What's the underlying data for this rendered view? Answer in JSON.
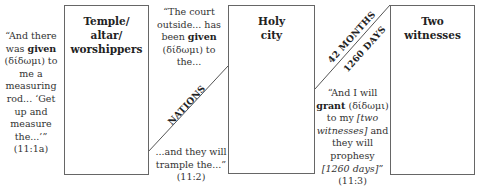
{
  "boxes": [
    {
      "id": "temple",
      "title_lines": [
        "Temple/",
        "altar/",
        "worshippers"
      ]
    },
    {
      "id": "holy-city",
      "title_lines": [
        "Holy",
        "city"
      ]
    },
    {
      "id": "two-witnesses",
      "title_lines": [
        "Two",
        "witnesses"
      ]
    }
  ],
  "quotes": {
    "q1": {
      "pre": "“And there was ",
      "bold": "given",
      "post1": " (δίδωμι) to me a measuring rod... ‘Get up and measure the...’”",
      "ref": "(11:1a)"
    },
    "q2a": {
      "pre": "“The court outside... has been ",
      "bold": "given",
      "post1": " (δίδωμι) to the..."
    },
    "q2b": {
      "text": "...and they will trample the...” (11:2)"
    },
    "q3": {
      "pre": "“And I will ",
      "bold": "grant",
      "post1": " (δίδωμι) to my ",
      "ital1": "[two witnesses]",
      "post2": " and they will prophesy ",
      "ital2": "[1260 days]",
      "post3": "”",
      "ref": "(11:3)"
    }
  },
  "diagonal_labels": {
    "nations": "NATIONS",
    "months": "42 MONTHS",
    "days": "1260 DAYS"
  },
  "colors": {
    "line": "#555555",
    "border": "#666666",
    "text": "#333333"
  }
}
